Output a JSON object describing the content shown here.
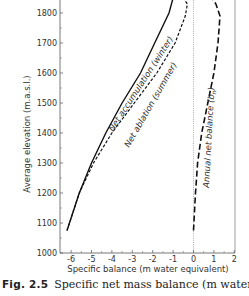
{
  "chart_data": {
    "type": "line",
    "title": "",
    "xlabel": "Specific balance (m water equivalent)",
    "ylabel": "Average elevation (m.a.s.l.)",
    "xlim": [
      -6.5,
      2
    ],
    "ylim": [
      1000,
      1850
    ],
    "xticks": [
      -6,
      -5,
      -4,
      -3,
      -2,
      -1,
      0,
      1,
      2
    ],
    "yticks": [
      1000,
      1100,
      1200,
      1300,
      1400,
      1500,
      1600,
      1700,
      1800
    ],
    "grid": false,
    "legend": "inline labels",
    "reference_line": {
      "x": 0,
      "style": "dotted"
    },
    "series": [
      {
        "name": "Net accumulation (winter)",
        "style": "solid",
        "points": [
          [
            -6.2,
            1075
          ],
          [
            -5.6,
            1200
          ],
          [
            -5.0,
            1300
          ],
          [
            -4.3,
            1400
          ],
          [
            -3.5,
            1500
          ],
          [
            -2.6,
            1600
          ],
          [
            -1.9,
            1700
          ],
          [
            -1.2,
            1800
          ],
          [
            -1.0,
            1850
          ]
        ]
      },
      {
        "name": "Net ablation (summer)",
        "style": "dashed",
        "points": [
          [
            -6.2,
            1075
          ],
          [
            -5.6,
            1200
          ],
          [
            -4.9,
            1300
          ],
          [
            -4.0,
            1400
          ],
          [
            -2.9,
            1500
          ],
          [
            -1.8,
            1600
          ],
          [
            -0.9,
            1700
          ],
          [
            -0.4,
            1790
          ],
          [
            -0.3,
            1830
          ],
          [
            -0.5,
            1850
          ]
        ]
      },
      {
        "name": "Annual net balance (b_n)",
        "style": "long-dashed",
        "points": [
          [
            0.0,
            1075
          ],
          [
            0.1,
            1200
          ],
          [
            0.2,
            1300
          ],
          [
            0.4,
            1400
          ],
          [
            0.7,
            1500
          ],
          [
            1.0,
            1600
          ],
          [
            1.2,
            1700
          ],
          [
            1.3,
            1790
          ],
          [
            1.1,
            1830
          ],
          [
            0.9,
            1850
          ]
        ]
      }
    ]
  },
  "labels": {
    "xlabel": "Specific balance (m water equivalent)",
    "ylabel": "Average elevation (m.a.s.l.)",
    "xticks": [
      "-6",
      "-5",
      "-4",
      "-3",
      "-2",
      "-1",
      "0",
      "1",
      "2"
    ],
    "yticks": [
      "1000",
      "1100",
      "1200",
      "1300",
      "1400",
      "1500",
      "1600",
      "1700",
      "1800"
    ],
    "series": [
      "Net accumulation (winter)",
      "Net ablation (summer)",
      "Annual net balance (b"
    ],
    "series_sub": "n",
    "series_close": ")"
  },
  "caption": {
    "fig": "Fig. 2.5",
    "text": "Specific net mass balance (m water"
  }
}
